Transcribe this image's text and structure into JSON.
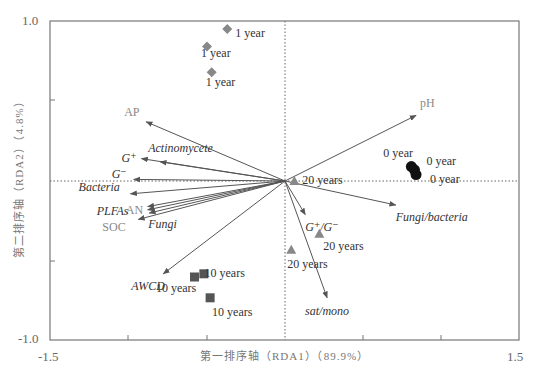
{
  "chart_data": {
    "type": "scatter",
    "title": "",
    "xlabel": "第一排序轴（RDA1）（89.9%）",
    "ylabel": "第二排序轴（RDA2）（4.8%）",
    "xlim": [
      -1.5,
      1.5
    ],
    "ylim": [
      -1.0,
      1.0
    ],
    "x_tick_labels": [
      "-1.5",
      "1.5"
    ],
    "y_tick_labels": [
      "1.0",
      "-1.0"
    ],
    "grid": false,
    "reference_lines": {
      "x": 0,
      "y": 0,
      "style": "dotted"
    },
    "samples": [
      {
        "group": "1 year",
        "marker": "diamond",
        "color": "#888888",
        "points": [
          [
            -0.37,
            0.95
          ],
          [
            -0.5,
            0.84
          ],
          [
            -0.47,
            0.68
          ]
        ]
      },
      {
        "group": "10 years",
        "marker": "square",
        "color": "#555555",
        "points": [
          [
            -0.58,
            -0.6
          ],
          [
            -0.52,
            -0.58
          ],
          [
            -0.48,
            -0.73
          ]
        ]
      },
      {
        "group": "20 years",
        "marker": "triangle",
        "color": "#888888",
        "points": [
          [
            0.06,
            0.0
          ],
          [
            0.22,
            -0.33
          ],
          [
            0.04,
            -0.43
          ]
        ]
      },
      {
        "group": "0 year",
        "marker": "circle",
        "color": "#111111",
        "points": [
          [
            0.81,
            0.09
          ],
          [
            0.83,
            0.07
          ],
          [
            0.84,
            0.04
          ]
        ]
      }
    ],
    "vectors": [
      {
        "name": "AP",
        "type": "environment",
        "x": -0.89,
        "y": 0.37
      },
      {
        "name": "pH",
        "type": "environment",
        "x": 0.84,
        "y": 0.41
      },
      {
        "name": "AN",
        "type": "environment",
        "x": -0.88,
        "y": -0.18
      },
      {
        "name": "SOC",
        "type": "environment",
        "x": -0.94,
        "y": -0.24
      },
      {
        "name": "G⁺",
        "type": "microbial",
        "x": -0.92,
        "y": 0.14
      },
      {
        "name": "Actinomycete",
        "type": "microbial",
        "x": -0.8,
        "y": 0.12
      },
      {
        "name": "G⁻",
        "type": "microbial",
        "x": -0.97,
        "y": 0.01
      },
      {
        "name": "Bacteria",
        "type": "microbial",
        "x": -0.99,
        "y": -0.08
      },
      {
        "name": "PLFAs",
        "type": "microbial",
        "x": -0.88,
        "y": -0.16
      },
      {
        "name": "Fungi",
        "type": "microbial",
        "x": -0.87,
        "y": -0.2
      },
      {
        "name": "AWCD",
        "type": "microbial",
        "x": -0.78,
        "y": -0.58
      },
      {
        "name": "G⁺/G⁻",
        "type": "microbial",
        "x": 0.13,
        "y": -0.21
      },
      {
        "name": "sat/mono",
        "type": "microbial",
        "x": 0.27,
        "y": -0.73
      },
      {
        "name": "Fungi/bacteria",
        "type": "microbial",
        "x": 0.71,
        "y": -0.15
      }
    ]
  },
  "axes": {
    "x_min_label": "-1.5",
    "x_max_label": "1.5",
    "y_max_label": "1.0",
    "y_min_label": "-1.0",
    "x_title": "第一排序轴（RDA1）（89.9%）",
    "y_title": "第二排序轴（RDA2）（4.8%）"
  },
  "colors": {
    "frame": "#777777",
    "environment_label": "#888888",
    "microbial_label": "#333333",
    "arrow": "#555555"
  }
}
